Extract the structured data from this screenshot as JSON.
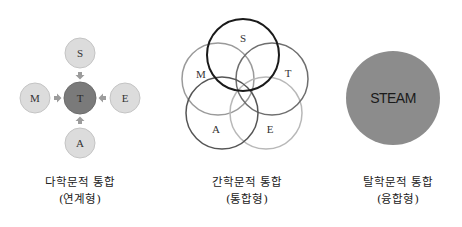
{
  "panels": [
    {
      "id": "multidisciplinary",
      "title": "다학문적 통합",
      "subtitle": "(연계형)",
      "center_node": "T",
      "outer_nodes": {
        "top": "S",
        "left": "M",
        "right": "E",
        "bottom": "A"
      }
    },
    {
      "id": "interdisciplinary",
      "title": "간학문적 통합",
      "subtitle": "(통합형)",
      "circles": [
        {
          "label": "S",
          "cx": 243,
          "cy": 55,
          "stroke": "#1a1a1a"
        },
        {
          "label": "M",
          "cx": 218,
          "cy": 79,
          "stroke": "#9a9a9a"
        },
        {
          "label": "T",
          "cx": 272,
          "cy": 79,
          "stroke": "#6e6e6e"
        },
        {
          "label": "A",
          "cx": 222,
          "cy": 113,
          "stroke": "#555555"
        },
        {
          "label": "E",
          "cx": 266,
          "cy": 113,
          "stroke": "#b8b8b8"
        }
      ]
    },
    {
      "id": "transdisciplinary",
      "title": "탈학문적 통합",
      "subtitle": "(융합형)",
      "center_label": "STEAM"
    }
  ],
  "colors": {
    "outer_node_fill": "#dcdcdc",
    "outer_node_stroke": "#c4c4c4",
    "center_node_fill": "#7a7a7a",
    "arrow_fill": "#9c9c9c",
    "steam_fill": "#8c8c8c"
  }
}
